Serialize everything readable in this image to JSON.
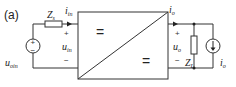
{
  "panel_label": "(a)",
  "source_side": {
    "voltage_source_label": "u",
    "voltage_source_sub": "oin",
    "impedance_label": "Z",
    "impedance_sub": "s",
    "current_label": "i",
    "current_sub": "in",
    "voltage_label": "u",
    "voltage_sub": "in",
    "plus": "+",
    "minus": "−"
  },
  "converter": {
    "input_symbol": "=",
    "output_symbol": "="
  },
  "load_side": {
    "current_label": "i",
    "current_sub": "o",
    "voltage_label": "u",
    "voltage_sub": "o",
    "impedance_label": "Z",
    "impedance_sub": "L",
    "current_source_label": "i",
    "current_source_sub": "o",
    "plus": "+",
    "minus": "−"
  },
  "colors": {
    "stroke": "#333333",
    "background": "#ffffff"
  }
}
